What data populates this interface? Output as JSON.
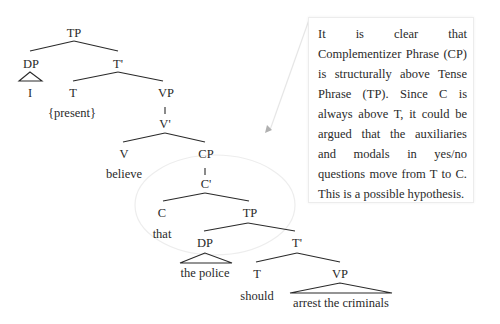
{
  "tree": {
    "nodes": {
      "tp_root": "TP",
      "dp1": "DP",
      "i": "I",
      "tbar1": "T'",
      "t1": "T",
      "present": "{present}",
      "vp1": "VP",
      "vbar": "V'",
      "v": "V",
      "believe": "believe",
      "cp": "CP",
      "cbar": "C'",
      "c": "C",
      "that": "that",
      "tp2": "TP",
      "dp2": "DP",
      "the_police": "the police",
      "tbar2": "T'",
      "t2": "T",
      "should": "should",
      "vp2": "VP",
      "arrest": "arrest the criminals"
    }
  },
  "callout": {
    "text": "It is clear that Complementizer Phrase (CP) is structurally above Tense Phrase (TP). Since C is always above T, it could be argued that the auxiliaries and modals in yes/no questions move from T to C. This is a possible hypothesis."
  },
  "colors": {
    "ink": "#2a2a2a",
    "highlight_ellipse": "#ececec",
    "pointer": "#bdbdbd"
  }
}
